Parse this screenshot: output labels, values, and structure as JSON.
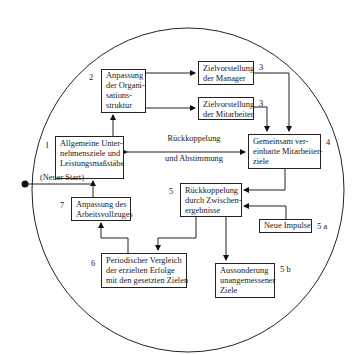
{
  "diagram": {
    "type": "circular process flow",
    "nodes": [
      {
        "id": "1",
        "number": "1",
        "lines": [
          "Allgemeine Unter-",
          "nehmensziele und",
          "Leistungsmaßstäbe"
        ]
      },
      {
        "id": "2",
        "number": "2",
        "lines": [
          "Anpassung",
          "der Organi-",
          "sations-",
          "struktur"
        ]
      },
      {
        "id": "3a",
        "number": "3",
        "lines": [
          "Zielvorstellung",
          "der Manager"
        ]
      },
      {
        "id": "3b",
        "number": "3",
        "lines": [
          "Zielvorstellung",
          "der Mitarbeiter"
        ]
      },
      {
        "id": "4",
        "number": "4",
        "lines": [
          "Gemeinsam ver-",
          "einbarte Mitarbeiter-",
          "ziele"
        ]
      },
      {
        "id": "5",
        "number": "5",
        "lines": [
          "Rückkoppelung",
          "durch Zwischen-",
          "ergebnisse"
        ]
      },
      {
        "id": "5a",
        "number": "5 a",
        "lines": [
          "Neue Impulse"
        ]
      },
      {
        "id": "5b",
        "number": "5 b",
        "lines": [
          "Aussonderung",
          "unangemessener",
          "Ziele"
        ]
      },
      {
        "id": "6",
        "number": "6",
        "lines": [
          "Periodischer Vergleich",
          "der erzielten Erfolge",
          "mit den gesetzten Zielen"
        ]
      },
      {
        "id": "7",
        "number": "7",
        "lines": [
          "Anpassung des",
          "Arbeitsvollzuges"
        ]
      }
    ],
    "labels": {
      "feedback_line1": "Rückkoppelung",
      "feedback_line2": "und Abstimmung",
      "restart": "(Neuer Start)"
    },
    "edges": [
      {
        "from": "1",
        "to": "2"
      },
      {
        "from": "2",
        "to": "3a"
      },
      {
        "from": "2",
        "to": "3b"
      },
      {
        "from": "3a",
        "to": "4"
      },
      {
        "from": "3b",
        "to": "4"
      },
      {
        "from": "1",
        "to": "4",
        "bidirectional": true,
        "label": "Rückkoppelung und Abstimmung"
      },
      {
        "from": "4",
        "to": "5"
      },
      {
        "from": "5a",
        "to": "5"
      },
      {
        "from": "5",
        "to": "5b"
      },
      {
        "from": "5",
        "to": "6"
      },
      {
        "from": "6",
        "to": "7"
      },
      {
        "from": "7",
        "to": "1"
      },
      {
        "from": "restart",
        "to": "1",
        "label": "(Neuer Start)"
      }
    ]
  }
}
